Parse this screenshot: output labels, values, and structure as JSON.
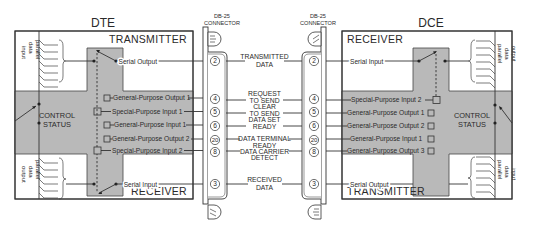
{
  "dte": {
    "title": "DTE",
    "transmitter_label": "TRANSMITTER",
    "receiver_label": "RECEIVER",
    "control_status": [
      "CONTROL",
      "STATUS"
    ],
    "parallel_input": [
      "parallel",
      "data",
      "input"
    ],
    "parallel_output": [
      "parallel",
      "data",
      "output"
    ],
    "serial_output": "Serial Output",
    "serial_input": "Serial Input",
    "control_lines": [
      "General-Purpose Output 1",
      "Special-Purpose Input 1",
      "General-Purpose Input 1",
      "General-Purpose Output 2",
      "Special-Purpose Input 2"
    ]
  },
  "dce": {
    "title": "DCE",
    "receiver_label": "RECEIVER",
    "transmitter_label": "TRANSMITTER",
    "control_status": [
      "CONTROL",
      "STATUS"
    ],
    "parallel_output": [
      "parallel",
      "data",
      "output"
    ],
    "parallel_input": [
      "parallel",
      "data",
      "input"
    ],
    "serial_input": "Serial Input",
    "serial_output": "Serial Output",
    "control_lines": [
      "Special-Purpose Input 2",
      "General-Purpose Output 1",
      "General-Purpose Output 2",
      "General-Purpose Input 1",
      "General-Purpose Output 3"
    ]
  },
  "connectors": {
    "left": [
      "DB-25",
      "CONNECTOR"
    ],
    "right": [
      "DB-25",
      "CONNECTOR"
    ]
  },
  "signals": [
    {
      "pin": "2",
      "label": [
        "TRANSMITTED",
        "DATA"
      ]
    },
    {
      "pin": "4",
      "label": [
        "REQUEST",
        "TO SEND"
      ]
    },
    {
      "pin": "5",
      "label": [
        "CLEAR",
        "TO SEND"
      ]
    },
    {
      "pin": "6",
      "label": [
        "DATA SET",
        "READY"
      ]
    },
    {
      "pin": "20",
      "label": [
        "DATA TERMINAL",
        "READY"
      ]
    },
    {
      "pin": "8",
      "label": [
        "DATA CARRIER",
        "DETECT"
      ]
    },
    {
      "pin": "3",
      "label": [
        "RECEIVED",
        "DATA"
      ]
    }
  ],
  "colors": {
    "panel_gray": "#b9b9b9",
    "line": "#333333",
    "background": "#ffffff"
  }
}
